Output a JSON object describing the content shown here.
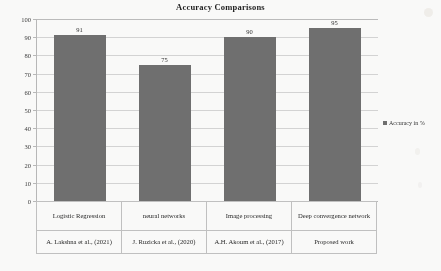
{
  "chart_data": {
    "type": "bar",
    "title": "Accuracy Comparisons",
    "xlabel": "",
    "ylabel": "",
    "ylim": [
      0,
      100
    ],
    "ytick_step": 10,
    "yticks": [
      0,
      10,
      20,
      30,
      40,
      50,
      60,
      70,
      80,
      90,
      100
    ],
    "grid": true,
    "legend_position": "right",
    "categories": [
      "Logistic Regression",
      "neural networks",
      "Image processing",
      "Deep convergence network"
    ],
    "citations": [
      "A. Lakshna et al., (2021)",
      "J. Ruzicka et al., (2020)",
      "A.H. Akoum et al., (2017)",
      "Proposed work"
    ],
    "series": [
      {
        "name": "Accuracy in %",
        "values": [
          91,
          75,
          90,
          95
        ],
        "color": "#6e6e6e"
      }
    ],
    "data_labels": [
      "91",
      "75",
      "90",
      "95"
    ]
  },
  "legend": {
    "entries": [
      {
        "label": "Accuracy in %",
        "marker": "square-marker",
        "color": "#6e6e6e"
      }
    ]
  },
  "colors": {
    "bar": "#6e6e6e",
    "gridline": "#d6d6d6",
    "axis": "#b9b9b9",
    "table_border": "#c2c2c2",
    "background": "#fdfdfc"
  }
}
